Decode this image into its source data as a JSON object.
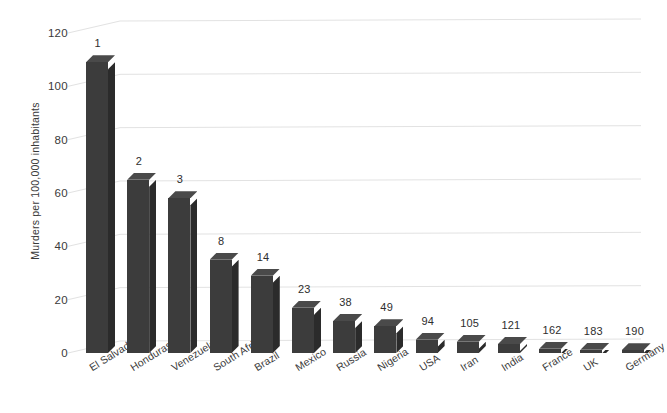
{
  "chart_data": {
    "type": "bar",
    "title": "",
    "subtitle": "",
    "xlabel": "",
    "ylabel": "Murders per 100,000 inhabitants",
    "ylim": [
      0,
      128
    ],
    "yticks": [
      0,
      20,
      40,
      60,
      80,
      100,
      120
    ],
    "ytick_labels": [
      "0",
      "20",
      "40",
      "60",
      "80",
      "100",
      "120"
    ],
    "grid": true,
    "legend": null,
    "legend_position": "none",
    "style": "3d-column",
    "categories": [
      "El Salvador",
      "Honduras",
      "Venezuela",
      "South Africa",
      "Brazil",
      "Mexico",
      "Russia",
      "Nigeria",
      "USA",
      "Iran",
      "India",
      "France",
      "UK",
      "Germany"
    ],
    "values": [
      109,
      65,
      58,
      35,
      29,
      17,
      12,
      10,
      5,
      4.2,
      3.4,
      1.6,
      1.2,
      1.0
    ],
    "data_labels": [
      "1",
      "2",
      "3",
      "8",
      "14",
      "23",
      "38",
      "49",
      "94",
      "105",
      "121",
      "162",
      "183",
      "190"
    ],
    "data_label_meaning": "world rank",
    "series": [
      {
        "name": "Murders per 100,000 inhabitants",
        "values": [
          109,
          65,
          58,
          35,
          29,
          17,
          12,
          10,
          5,
          4.2,
          3.4,
          1.6,
          1.2,
          1.0
        ]
      }
    ],
    "colors": {
      "bar_front": "#3c3c3c",
      "bar_side": "#2b2b2b",
      "bar_top": "#4a4a4a",
      "gridline": "#e2e2e2",
      "text": "#3a3a3a",
      "background": "#ffffff"
    }
  }
}
